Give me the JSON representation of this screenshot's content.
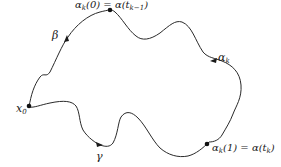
{
  "diagram": {
    "type": "path-homotopy-curve",
    "stroke_color": "#2a2a2a",
    "labels": {
      "start_point": "x",
      "start_point_sub": "0",
      "beta": "β",
      "gamma": "γ",
      "alpha_k_main": "α",
      "alpha_k_sub": "k",
      "top_point_lhs": "α",
      "top_point_lhs_sub": "k",
      "top_point_eq": "(0) = α(t",
      "top_point_sub": "k−1",
      "top_point_close": ")",
      "bottom_point_lhs": "α",
      "bottom_point_lhs_sub": "k",
      "bottom_point_eq": "(1) = α(t",
      "bottom_point_sub": "k",
      "bottom_point_close": ")"
    }
  }
}
